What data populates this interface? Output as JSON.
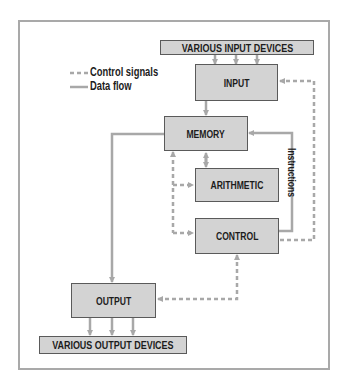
{
  "diagram": {
    "legend": {
      "control_signals": "Control signals",
      "data_flow": "Data flow"
    },
    "boxes": {
      "input_devices": "VARIOUS INPUT DEVICES",
      "input": "INPUT",
      "memory": "MEMORY",
      "arithmetic": "ARITHMETIC",
      "control": "CONTROL",
      "output": "OUTPUT",
      "output_devices": "VARIOUS OUTPUT DEVICES"
    },
    "edge_labels": {
      "instructions": "Instructions"
    },
    "colors": {
      "box_fill": "#d3d3d3",
      "box_border": "#5a5a5a",
      "line": "#a8a8a8",
      "text": "#1c1c1c"
    }
  }
}
